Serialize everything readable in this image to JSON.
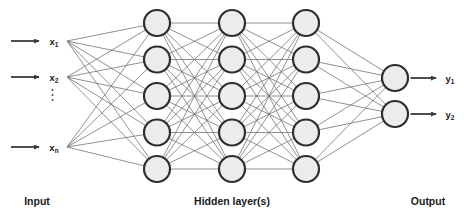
{
  "diagram": {
    "type": "feedforward-neural-network",
    "section_labels": {
      "input": "Input",
      "hidden": "Hidden layer(s)",
      "output": "Output"
    },
    "input_nodes": [
      {
        "base": "x",
        "sub": "1"
      },
      {
        "base": "x",
        "sub": "2"
      },
      {
        "base": "x",
        "sub": "n"
      }
    ],
    "input_ellipsis": "⋮",
    "hidden_layers": [
      5,
      5,
      5
    ],
    "output_nodes": [
      {
        "base": "y",
        "sub": "1"
      },
      {
        "base": "y",
        "sub": "2"
      }
    ],
    "colors": {
      "background": "#ffffff",
      "node_fill": "#ececec",
      "node_stroke": "#2e2e2e",
      "connection": "#757575",
      "arrow": "#3a3a3a",
      "text": "#1a1a1a"
    }
  }
}
